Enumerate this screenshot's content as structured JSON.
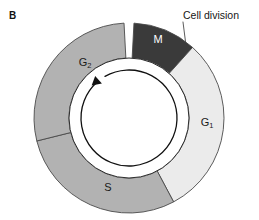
{
  "figure": {
    "panel_letter": "B",
    "callout": {
      "label": "Cell division",
      "points_to": "M"
    },
    "diagram_type": "cell-cycle-ring",
    "center": {
      "x": 129,
      "y": 118
    },
    "outer_radius": 95,
    "inner_radius": 60,
    "segments": [
      {
        "id": "M",
        "label": "M",
        "label_sub": "",
        "phase_name": "M",
        "color": "#3a3a3a",
        "label_color": "#ffffff",
        "start_deg": 3,
        "end_deg": 42,
        "label_x": 158,
        "label_y": 40
      },
      {
        "id": "G1",
        "label": "G",
        "label_sub": "1",
        "phase_name": "G1",
        "color": "#ebebeb",
        "label_color": "#1a1a1a",
        "start_deg": 42,
        "end_deg": 152,
        "label_x": 207,
        "label_y": 123
      },
      {
        "id": "S",
        "label": "S",
        "label_sub": "",
        "phase_name": "S",
        "color": "#b2b2b2",
        "label_color": "#1a1a1a",
        "start_deg": 152,
        "end_deg": 256,
        "label_x": 108,
        "label_y": 188
      },
      {
        "id": "G2",
        "label": "G",
        "label_sub": "2",
        "phase_name": "G2",
        "color": "#b2b2b2",
        "label_color": "#1a1a1a",
        "start_deg": 256,
        "end_deg": 357,
        "label_x": 85,
        "label_y": 63
      }
    ],
    "cycle_arrow": {
      "direction": "clockwise-drawn-arrowhead-upper-left",
      "radius": 48,
      "stroke": "#111111"
    },
    "colors": {
      "background": "#ffffff",
      "outline": "#4a4a4a",
      "inner_circle_stroke": "#2b2b2b",
      "text": "#1a1a1a"
    }
  },
  "chart_data": {
    "type": "pie",
    "categories": [
      "M",
      "G1",
      "S",
      "G2"
    ],
    "values": [
      39,
      110,
      104,
      101
    ],
    "unit": "degrees of arc",
    "colors": [
      "#3a3a3a",
      "#ebebeb",
      "#b2b2b2",
      "#b2b2b2"
    ],
    "annotations": [
      "Cell division"
    ],
    "legend": "none",
    "grid": false
  }
}
